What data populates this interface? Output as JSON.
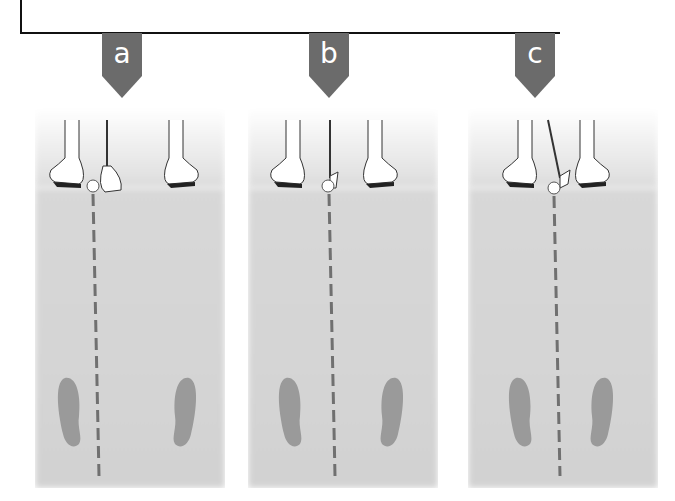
{
  "figure": {
    "panels": [
      {
        "label": "a",
        "club": "driver",
        "ball_position": "forward, inside left heel"
      },
      {
        "label": "b",
        "club": "iron",
        "ball_position": "center-left"
      },
      {
        "label": "c",
        "club": "short iron / wedge",
        "ball_position": "center"
      }
    ],
    "colors": {
      "marker": "#6b6b6b",
      "ground": "#d6d6d6",
      "footprint": "#9a9a9a",
      "target_line": "#707070",
      "frame": "#111111"
    }
  }
}
